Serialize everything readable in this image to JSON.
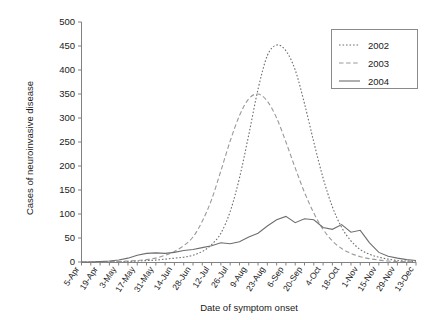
{
  "chart_data": {
    "type": "line",
    "title": "",
    "xlabel": "Date of symptom onset",
    "ylabel": "Cases of neuroinvasive disease",
    "ylim": [
      0,
      500
    ],
    "ytick_step": 50,
    "yticks": [
      0,
      50,
      100,
      150,
      200,
      250,
      300,
      350,
      400,
      450,
      500
    ],
    "grid": false,
    "legend_position": "top-right",
    "x_tick_interval_weeks": 1,
    "x_label_interval_weeks": 2,
    "categories": [
      "5-Apr",
      "12-Apr",
      "19-Apr",
      "26-Apr",
      "3-May",
      "10-May",
      "17-May",
      "24-May",
      "31-May",
      "7-Jun",
      "14-Jun",
      "21-Jun",
      "28-Jun",
      "5-Jul",
      "12-Jul",
      "19-Jul",
      "26-Jul",
      "2-Aug",
      "9-Aug",
      "16-Aug",
      "23-Aug",
      "30-Aug",
      "6-Sep",
      "13-Sep",
      "20-Sep",
      "27-Sep",
      "4-Oct",
      "11-Oct",
      "18-Oct",
      "25-Oct",
      "1-Nov",
      "8-Nov",
      "15-Nov",
      "22-Nov",
      "29-Nov",
      "6-Dec",
      "13-Dec"
    ],
    "tick_labels": [
      "5-Apr",
      "19-Apr",
      "3-May",
      "17-May",
      "31-May",
      "14-Jun",
      "28-Jun",
      "12-Jul",
      "26-Jul",
      "9-Aug",
      "23-Aug",
      "6-Sep",
      "20-Sep",
      "4-Oct",
      "18-Oct",
      "1-Nov",
      "15-Nov",
      "29-Nov",
      "13-Dec"
    ],
    "series": [
      {
        "name": "2002",
        "style": "dotted",
        "color": "#6e6e6e",
        "values": [
          0,
          0,
          0,
          0,
          1,
          1,
          2,
          3,
          4,
          6,
          8,
          10,
          14,
          22,
          36,
          60,
          105,
          175,
          265,
          360,
          430,
          452,
          440,
          400,
          330,
          250,
          175,
          115,
          72,
          44,
          26,
          16,
          10,
          6,
          3,
          2,
          1
        ]
      },
      {
        "name": "2003",
        "style": "dashed",
        "color": "#9a9a9a",
        "values": [
          0,
          0,
          0,
          1,
          1,
          2,
          3,
          5,
          8,
          14,
          22,
          34,
          52,
          85,
          130,
          190,
          252,
          305,
          340,
          350,
          335,
          300,
          250,
          196,
          145,
          102,
          68,
          44,
          28,
          18,
          11,
          7,
          4,
          2,
          1,
          1,
          0
        ]
      },
      {
        "name": "2004",
        "style": "solid",
        "color": "#6e6e6e",
        "values": [
          0,
          0,
          1,
          2,
          4,
          8,
          14,
          18,
          19,
          18,
          20,
          24,
          26,
          30,
          34,
          40,
          38,
          42,
          52,
          60,
          75,
          88,
          95,
          82,
          90,
          88,
          72,
          68,
          78,
          62,
          66,
          40,
          20,
          12,
          8,
          5,
          3
        ]
      }
    ]
  },
  "legend": {
    "entries": [
      {
        "label": "2002"
      },
      {
        "label": "2003"
      },
      {
        "label": "2004"
      }
    ]
  }
}
